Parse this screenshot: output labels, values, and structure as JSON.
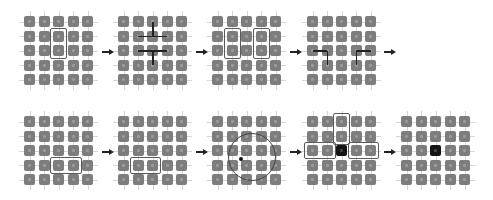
{
  "diagram": {
    "grid_size": 5,
    "cell_pitch": 14.5,
    "colors": {
      "cell": "#7d7d7d",
      "cell_active": "#141414",
      "grid_line": "#d6d6d6",
      "box": "#5a5a5a",
      "link": "#222222"
    },
    "panels": [
      {
        "id": "step-1",
        "x": 24,
        "y": 16,
        "boxes": [
          {
            "col": 2,
            "row": 1,
            "w": 1,
            "h": 2
          }
        ],
        "links": [],
        "circle": null,
        "active": []
      },
      {
        "id": "step-2",
        "x": 118,
        "y": 16,
        "boxes": [],
        "links": [
          {
            "from": [
              1,
              1
            ],
            "to": [
              3,
              1
            ]
          },
          {
            "from": [
              1,
              2
            ],
            "to": [
              3,
              2
            ]
          },
          {
            "from": [
              2,
              0
            ],
            "to": [
              2,
              1
            ]
          },
          {
            "from": [
              2,
              2
            ],
            "to": [
              2,
              3
            ]
          }
        ],
        "circle": null,
        "active": []
      },
      {
        "id": "step-3",
        "x": 212,
        "y": 16,
        "boxes": [
          {
            "col": 1,
            "row": 1,
            "w": 1,
            "h": 2
          },
          {
            "col": 3,
            "row": 1,
            "w": 1,
            "h": 2
          }
        ],
        "links": [],
        "circle": null,
        "active": []
      },
      {
        "id": "step-4",
        "x": 307,
        "y": 16,
        "boxes": [],
        "links": [
          {
            "from": [
              0,
              2
            ],
            "to": [
              1,
              2
            ]
          },
          {
            "from": [
              1,
              2
            ],
            "to": [
              1,
              3
            ]
          },
          {
            "from": [
              3,
              2
            ],
            "to": [
              4,
              2
            ]
          },
          {
            "from": [
              3,
              2
            ],
            "to": [
              3,
              3
            ]
          }
        ],
        "circle": null,
        "active": []
      },
      {
        "id": "step-5",
        "x": 24,
        "y": 116,
        "boxes": [
          {
            "col": 2,
            "row": 3,
            "w": 2,
            "h": 1
          }
        ],
        "links": [],
        "circle": null,
        "active": []
      },
      {
        "id": "step-6",
        "x": 118,
        "y": 116,
        "boxes": [
          {
            "col": 1,
            "row": 3,
            "w": 2,
            "h": 1
          }
        ],
        "links": [],
        "circle": null,
        "active": []
      },
      {
        "id": "step-7",
        "x": 212,
        "y": 116,
        "boxes": [],
        "links": [],
        "circle": {
          "cx": 2.3,
          "cy": 2.4,
          "r": 1.6,
          "node": [
            1.6,
            2.6
          ]
        },
        "active": []
      },
      {
        "id": "step-8",
        "x": 307,
        "y": 116,
        "boxes": [
          {
            "col": 2,
            "row": 0,
            "w": 1,
            "h": 2
          },
          {
            "col": 0,
            "row": 2,
            "w": 2,
            "h": 1
          },
          {
            "col": 3,
            "row": 2,
            "w": 2,
            "h": 1
          }
        ],
        "links": [],
        "circle": null,
        "active": [
          [
            2,
            2
          ]
        ]
      },
      {
        "id": "step-9",
        "x": 401,
        "y": 116,
        "boxes": [],
        "links": [],
        "circle": null,
        "active": [
          [
            2,
            2
          ]
        ]
      }
    ],
    "arrows": [
      {
        "x": 102,
        "y": 49
      },
      {
        "x": 196,
        "y": 49
      },
      {
        "x": 290,
        "y": 49
      },
      {
        "x": 384,
        "y": 49
      },
      {
        "x": 102,
        "y": 149
      },
      {
        "x": 196,
        "y": 149
      },
      {
        "x": 290,
        "y": 149
      },
      {
        "x": 384,
        "y": 149
      }
    ]
  }
}
